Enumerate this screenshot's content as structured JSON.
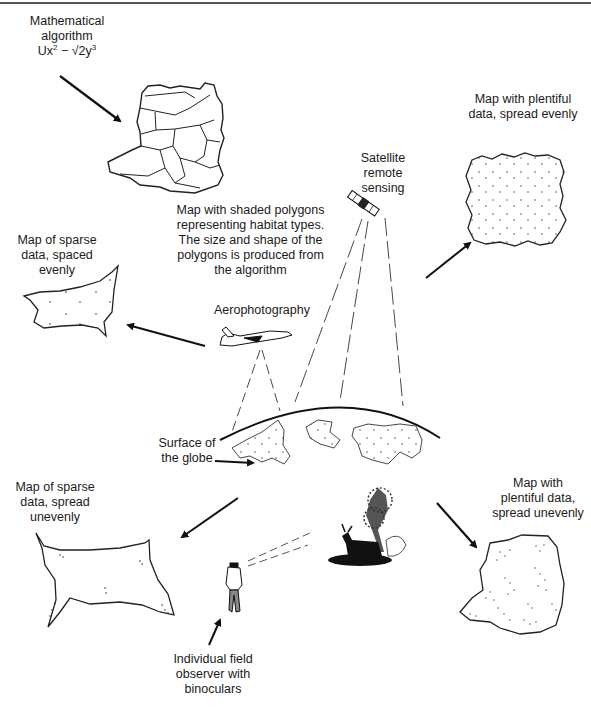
{
  "diagram": {
    "labels": {
      "algorithm": {
        "line1": "Mathematical",
        "line2": "algorithm",
        "formula_prefix": "Ux",
        "formula_exp1": "2",
        "formula_mid": " − √2y",
        "formula_exp2": "3"
      },
      "polygons_caption": [
        "Map with shaded polygons",
        "representing habitat types.",
        "The size and shape of the",
        "polygons is produced from",
        "the algorithm"
      ],
      "satellite": [
        "Satellite",
        "remote",
        "sensing"
      ],
      "plentiful_even": [
        "Map with plentiful",
        "data, spread evenly"
      ],
      "sparse_even": [
        "Map of sparse",
        "data, spaced",
        "evenly"
      ],
      "aerophotography": "Aerophotography",
      "surface_globe": [
        "Surface of",
        "the globe"
      ],
      "sparse_uneven": [
        "Map of sparse",
        "data, spread",
        "unevenly"
      ],
      "plentiful_uneven": [
        "Map with",
        "plentiful data,",
        "spread unevenly"
      ],
      "field_observer": [
        "Individual field",
        "observer with",
        "binoculars"
      ]
    },
    "nodes": [
      {
        "id": "algorithm",
        "icon": "formula"
      },
      {
        "id": "polygon-map",
        "icon": "polygon-map-icon"
      },
      {
        "id": "satellite",
        "icon": "satellite-icon"
      },
      {
        "id": "aeroplane",
        "icon": "airplane-icon"
      },
      {
        "id": "globe",
        "icon": "globe-surface-icon"
      },
      {
        "id": "field-observer",
        "icon": "person-binoculars-icon"
      },
      {
        "id": "wildlife-scene",
        "icon": "deer-tree-icon"
      }
    ],
    "edges": [
      {
        "from": "algorithm",
        "to": "polygon-map"
      },
      {
        "from": "satellite",
        "to": "plentiful-even-map"
      },
      {
        "from": "aeroplane",
        "to": "sparse-even-map"
      },
      {
        "from": "surface-label",
        "to": "globe"
      },
      {
        "from": "field-observer",
        "to": "sparse-uneven-map"
      },
      {
        "from": "wildlife-scene",
        "to": "plentiful-uneven-map"
      },
      {
        "from": "observer-label",
        "to": "field-observer"
      }
    ]
  }
}
